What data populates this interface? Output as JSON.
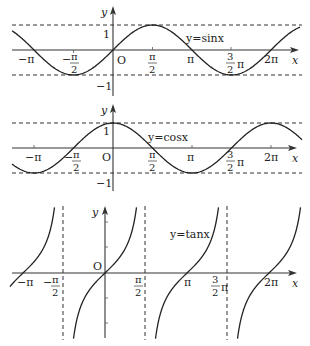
{
  "figure": {
    "panels": [
      {
        "id": "sin",
        "function_label": "y=sinx",
        "y_axis_label": "y",
        "x_axis_label": "x",
        "origin_label": "O",
        "y_ticks": [
          "1",
          "−1"
        ],
        "x_ticks": [
          "−π",
          "−π/2",
          "π/2",
          "π",
          "3/2 π",
          "2π"
        ]
      },
      {
        "id": "cos",
        "function_label": "y=cosx",
        "y_axis_label": "y",
        "x_axis_label": "x",
        "origin_label": "O",
        "y_ticks": [
          "1",
          "−1"
        ],
        "x_ticks": [
          "−π",
          "−π/2",
          "π/2",
          "π",
          "3/2 π",
          "2π"
        ]
      },
      {
        "id": "tan",
        "function_label": "y=tanx",
        "y_axis_label": "y",
        "x_axis_label": "x",
        "origin_label": "O",
        "x_ticks": [
          "−π",
          "−π/2",
          "π/2",
          "π",
          "3/2 π",
          "2π"
        ],
        "asymptotes": [
          "x=−π/2",
          "x=π/2",
          "x=3π/2"
        ]
      }
    ],
    "labels": {
      "y": "y",
      "x": "x",
      "O": "O",
      "one": "1",
      "neg_one": "−1",
      "pi": "π",
      "neg_pi": "−π",
      "neg": "−",
      "two": "2",
      "three": "3",
      "two_pi": "2π",
      "sin": "y=sinx",
      "cos": "y=cosx",
      "tan": "y=tanx"
    }
  },
  "chart_data": [
    {
      "type": "line",
      "title": "y=sinx",
      "xlabel": "x",
      "ylabel": "y",
      "x_range": [
        "-1.3π",
        "2.4π"
      ],
      "ylim": [
        -1,
        1
      ],
      "x_tick_labels": [
        "−π",
        "−π/2",
        "π/2",
        "π",
        "3π/2",
        "2π"
      ],
      "x": [
        -3.1416,
        -1.5708,
        0,
        1.5708,
        3.1416,
        4.7124,
        6.2832
      ],
      "values": [
        0,
        -1,
        0,
        1,
        0,
        -1,
        0
      ],
      "reference_lines": [
        {
          "y": 1,
          "style": "dashed"
        },
        {
          "y": -1,
          "style": "dashed"
        }
      ],
      "grid": false
    },
    {
      "type": "line",
      "title": "y=cosx",
      "xlabel": "x",
      "ylabel": "y",
      "x_range": [
        "-1.3π",
        "2.4π"
      ],
      "ylim": [
        -1,
        1
      ],
      "x_tick_labels": [
        "−π",
        "−π/2",
        "π/2",
        "π",
        "3π/2",
        "2π"
      ],
      "x": [
        -3.1416,
        -1.5708,
        0,
        1.5708,
        3.1416,
        4.7124,
        6.2832
      ],
      "values": [
        -1,
        0,
        1,
        0,
        -1,
        0,
        1
      ],
      "reference_lines": [
        {
          "y": 1,
          "style": "dashed"
        },
        {
          "y": -1,
          "style": "dashed"
        }
      ],
      "grid": false
    },
    {
      "type": "line",
      "title": "y=tanx",
      "xlabel": "x",
      "ylabel": "y",
      "x_tick_labels": [
        "−π",
        "−π/2",
        "π/2",
        "π",
        "3π/2",
        "2π"
      ],
      "x": [
        -3.1416,
        0,
        3.1416,
        6.2832
      ],
      "values": [
        0,
        0,
        0,
        0
      ],
      "asymptotes_x": [
        -1.5708,
        1.5708,
        4.7124
      ],
      "grid": false
    }
  ]
}
